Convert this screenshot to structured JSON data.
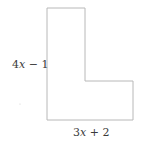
{
  "diagram": {
    "shape": "L-shaped polygon",
    "stroke_color": "#b8b8b8",
    "vertices": [
      [
        47,
        8
      ],
      [
        85,
        8
      ],
      [
        85,
        81
      ],
      [
        133,
        81
      ],
      [
        133,
        120
      ],
      [
        47,
        120
      ]
    ],
    "labels": {
      "height": {
        "coef": "4",
        "var": "x",
        "rest": " − 1"
      },
      "width": {
        "coef": "3",
        "var": "x",
        "rest": " + 2"
      }
    }
  }
}
